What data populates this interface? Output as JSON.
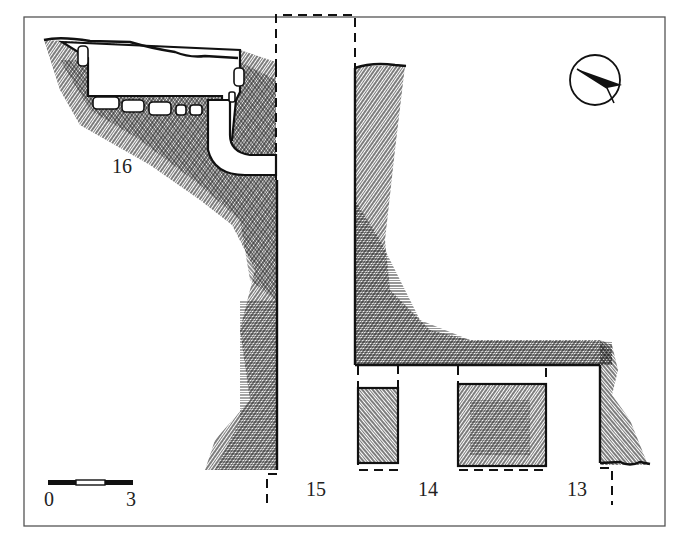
{
  "figure": {
    "type": "archaeological site plan",
    "background": "#ffffff",
    "ink_color": "#111111"
  },
  "labels": {
    "room_16": "16",
    "room_15": "15",
    "room_14": "14",
    "room_13": "13"
  },
  "scale_bar": {
    "start_label": "0",
    "end_label": "3",
    "segments": [
      "filled",
      "empty",
      "filled"
    ]
  },
  "north_arrow": {
    "icon": "north-arrow-icon",
    "direction": "pointing roughly west-north-west"
  },
  "legend_fills": {
    "masonry": "cross-hatched stone wall",
    "openings": "dashed lines indicate reconstructed / unexcavated limits"
  }
}
